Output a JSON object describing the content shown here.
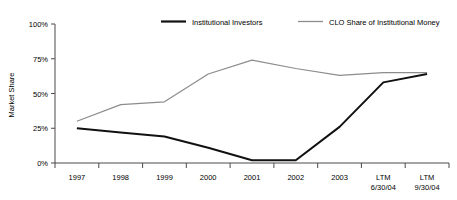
{
  "chart_data": {
    "type": "line",
    "title": "",
    "xlabel": "",
    "ylabel": "Market Share",
    "ylim": [
      0,
      100
    ],
    "ytick_labels": [
      "0%",
      "25%",
      "50%",
      "75%",
      "100%"
    ],
    "ytick_values": [
      0,
      25,
      50,
      75,
      100
    ],
    "grid": false,
    "legend_position": "top",
    "categories": [
      "1997",
      "1998",
      "1999",
      "2000",
      "2001",
      "2002",
      "2003",
      "LTM 6/30/04",
      "LTM 9/30/04"
    ],
    "category_lines": [
      [
        "1997"
      ],
      [
        "1998"
      ],
      [
        "1999"
      ],
      [
        "2000"
      ],
      [
        "2001"
      ],
      [
        "2002"
      ],
      [
        "2003"
      ],
      [
        "LTM",
        "6/30/04"
      ],
      [
        "LTM",
        "9/30/04"
      ]
    ],
    "series": [
      {
        "name": "Institutional Investors",
        "color": "#111111",
        "values": [
          25,
          22,
          19,
          11,
          2,
          2,
          26,
          58,
          64
        ]
      },
      {
        "name": "CLO Share of Institutional Money",
        "color": "#8c8c8c",
        "values": [
          30,
          42,
          44,
          64,
          74,
          68,
          63,
          65,
          65
        ]
      }
    ]
  },
  "legend": {
    "items": [
      {
        "label": "Institutional Investors"
      },
      {
        "label": "CLO Share of Institutional Money"
      }
    ]
  }
}
